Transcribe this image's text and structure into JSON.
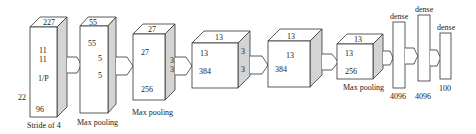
{
  "diagram": {
    "type": "cnn-architecture",
    "layers": [
      {
        "id": "input",
        "front_labels": [
          "11",
          "11",
          "1/P",
          "96"
        ],
        "top_label": "227",
        "left_label": "22",
        "caption": "Stride of 4"
      },
      {
        "id": "conv1",
        "front_labels": [
          "55",
          "5",
          "5"
        ],
        "top_label": "55",
        "caption": "Max pooling"
      },
      {
        "id": "conv2",
        "front_labels": [
          "27",
          "256"
        ],
        "top_label": "27",
        "side_labels": [
          "3",
          "3"
        ],
        "caption": "Max pooling"
      },
      {
        "id": "conv3",
        "front_labels": [
          "13",
          "384"
        ],
        "top_label": "13",
        "side_labels": [
          "3",
          "3"
        ]
      },
      {
        "id": "conv4",
        "front_labels": [
          "13",
          "384"
        ],
        "top_label": "13"
      },
      {
        "id": "conv5",
        "front_labels": [
          "13",
          "256"
        ],
        "top_label": "13",
        "caption": "Max pooling"
      },
      {
        "id": "fc1",
        "top_label": "dense",
        "bottom_label": "4096"
      },
      {
        "id": "fc2",
        "top_label": "dense",
        "bottom_label": "4096"
      },
      {
        "id": "fc3",
        "top_label": "dense",
        "bottom_label": "100"
      }
    ]
  }
}
